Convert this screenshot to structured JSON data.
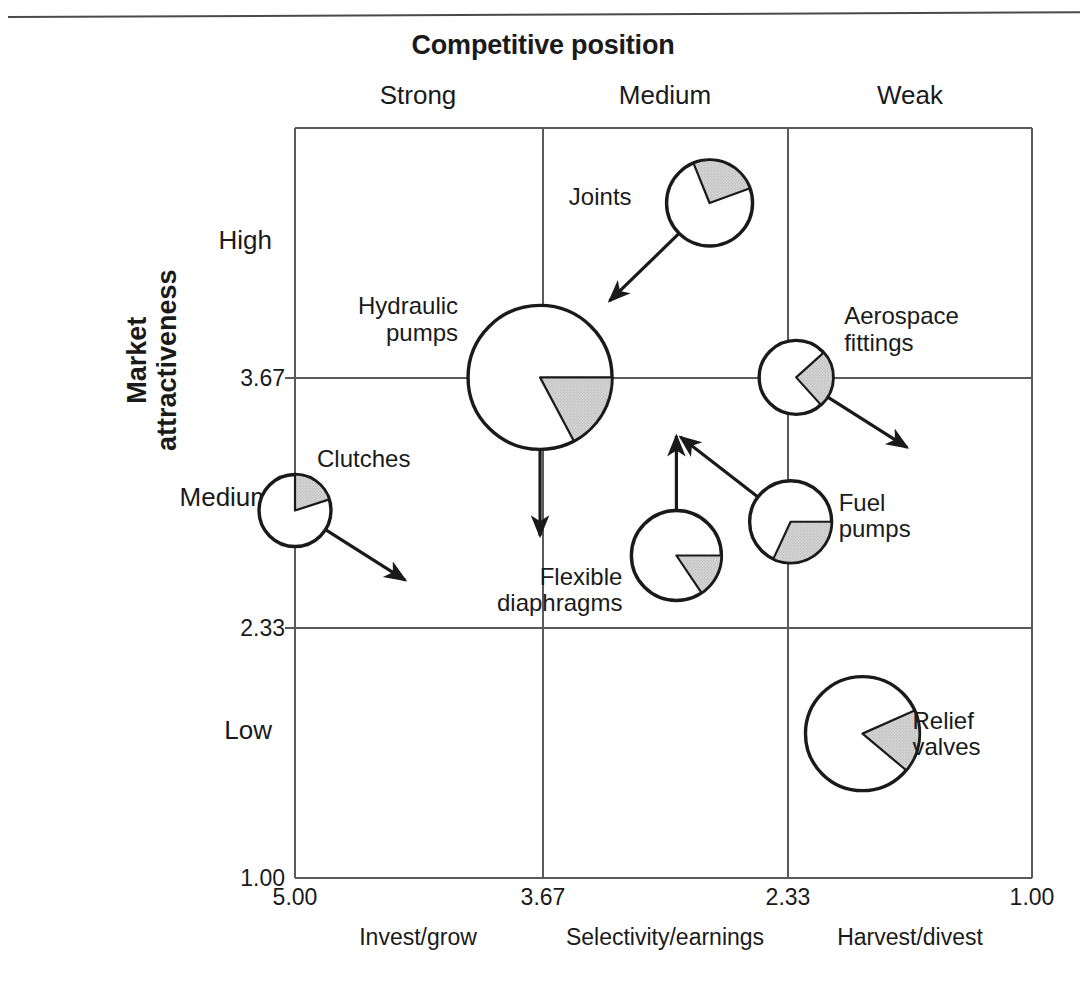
{
  "page": {
    "cut_off_header_text": "",
    "title": "Competitive position"
  },
  "axes": {
    "x": {
      "title": "Competitive position",
      "categories": [
        "Strong",
        "Medium",
        "Weak"
      ],
      "ticks": [
        "5.00",
        "3.67",
        "2.33",
        "1.00"
      ],
      "strategies": [
        "Invest/grow",
        "Selectivity/earnings",
        "Harvest/divest"
      ],
      "range_left_value": 5.0,
      "range_right_value": 1.0
    },
    "y": {
      "title_line1": "Market",
      "title_line2": "attractiveness",
      "categories": [
        "High",
        "Medium",
        "Low"
      ],
      "ticks": [
        "3.67",
        "2.33",
        "1.00"
      ],
      "range_top_value": 5.0,
      "range_bottom_value": 1.0
    }
  },
  "colors": {
    "wedge_fill": "#d2d2d2",
    "outline": "#1a1a1a",
    "gridline": "#5a5a5a",
    "text": "#1a1a1a"
  },
  "chart_data": {
    "type": "scatter",
    "title": "Competitive position",
    "xlabel": "Competitive position",
    "ylabel": "Market attractiveness",
    "xlim": [
      5.0,
      1.0
    ],
    "ylim": [
      1.0,
      5.0
    ],
    "grid": true,
    "legend": "none",
    "note": "GE/McKinsey nine-box matrix. Each business is a circle sized by market size; the shaded pie wedge is the company's market share; arrows show expected directional movement.",
    "xticks": [
      5.0,
      3.67,
      2.33,
      1.0
    ],
    "yticks": [
      3.67,
      2.33,
      1.0
    ],
    "points": [
      {
        "label": "Joints",
        "label_lines": [
          "Joints"
        ],
        "x": 2.75,
        "y": 4.6,
        "radius_px": 43,
        "share_pct": 25,
        "wedge_start_deg": 112,
        "wedge_end_deg": 20,
        "arrow": "down-left"
      },
      {
        "label": "Hydraulic pumps",
        "label_lines": [
          "Hydraulic",
          "pumps"
        ],
        "x": 3.67,
        "y": 3.67,
        "radius_px": 72,
        "share_pct": 17,
        "wedge_start_deg": 0,
        "wedge_end_deg": -62,
        "arrow": "down"
      },
      {
        "label": "Aerospace fittings",
        "label_lines": [
          "Aerospace",
          "fittings"
        ],
        "x": 2.28,
        "y": 3.67,
        "radius_px": 37,
        "share_pct": 25,
        "wedge_start_deg": 42,
        "wedge_end_deg": -48,
        "arrow": "down-right"
      },
      {
        "label": "Clutches",
        "label_lines": [
          "Clutches"
        ],
        "x": 5.0,
        "y": 2.96,
        "radius_px": 36,
        "share_pct": 20,
        "wedge_start_deg": 90,
        "wedge_end_deg": 18,
        "arrow": "down-right"
      },
      {
        "label": "Fuel pumps",
        "label_lines": [
          "Fuel",
          "pumps"
        ],
        "x": 2.31,
        "y": 2.9,
        "radius_px": 41,
        "share_pct": 31,
        "wedge_start_deg": 0,
        "wedge_end_deg": -115,
        "arrow": "up-left"
      },
      {
        "label": "Flexible diaphragms",
        "label_lines": [
          "Flexible",
          "diaphragms"
        ],
        "x": 2.93,
        "y": 2.72,
        "radius_px": 45,
        "share_pct": 16,
        "wedge_start_deg": 0,
        "wedge_end_deg": -56,
        "arrow": "up"
      },
      {
        "label": "Relief valves",
        "label_lines": [
          "Relief",
          "valves"
        ],
        "x": 1.92,
        "y": 1.77,
        "radius_px": 57,
        "share_pct": 18,
        "wedge_start_deg": 24,
        "wedge_end_deg": -40,
        "arrow": "none"
      }
    ]
  },
  "geometry": {
    "plot_left": 295,
    "plot_right": 1032,
    "plot_top": 128,
    "plot_bottom": 878,
    "vline_367": 543,
    "vline_233": 788,
    "hline_367": 378,
    "hline_233": 628,
    "col_head_y": 80,
    "col_head_x": [
      418,
      665,
      910
    ],
    "row_head_y": [
      240,
      497,
      730
    ],
    "row_head_x": 272,
    "ytick_x": 285,
    "xtick_x": [
      295,
      543,
      788,
      1032
    ],
    "xstrategy_x": [
      418,
      665,
      910
    ]
  }
}
